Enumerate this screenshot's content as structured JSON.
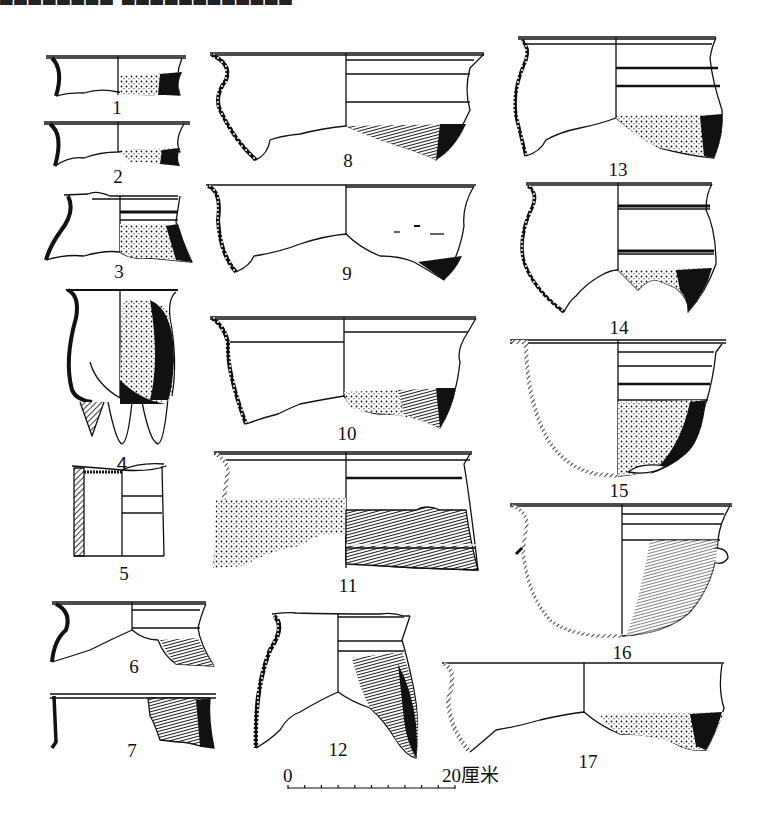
{
  "figure": {
    "caption_cropped": "▆▆▆▆▆▆▆▆ ▆▆▆▆▆▆▆▆▆▆▆▆",
    "ink_color": "#111111",
    "background_color": "#ffffff",
    "vessels": [
      {
        "id": 1,
        "label": "1"
      },
      {
        "id": 2,
        "label": "2"
      },
      {
        "id": 3,
        "label": "3"
      },
      {
        "id": 4,
        "label": "4"
      },
      {
        "id": 5,
        "label": "5"
      },
      {
        "id": 6,
        "label": "6"
      },
      {
        "id": 7,
        "label": "7"
      },
      {
        "id": 8,
        "label": "8"
      },
      {
        "id": 9,
        "label": "9"
      },
      {
        "id": 10,
        "label": "10"
      },
      {
        "id": 11,
        "label": "11"
      },
      {
        "id": 12,
        "label": "12"
      },
      {
        "id": 13,
        "label": "13"
      },
      {
        "id": 14,
        "label": "14"
      },
      {
        "id": 15,
        "label": "15"
      },
      {
        "id": 16,
        "label": "16"
      },
      {
        "id": 17,
        "label": "17"
      }
    ],
    "scale_bar": {
      "start_label": "0",
      "end_label": "20厘米",
      "divisions": 10
    }
  }
}
